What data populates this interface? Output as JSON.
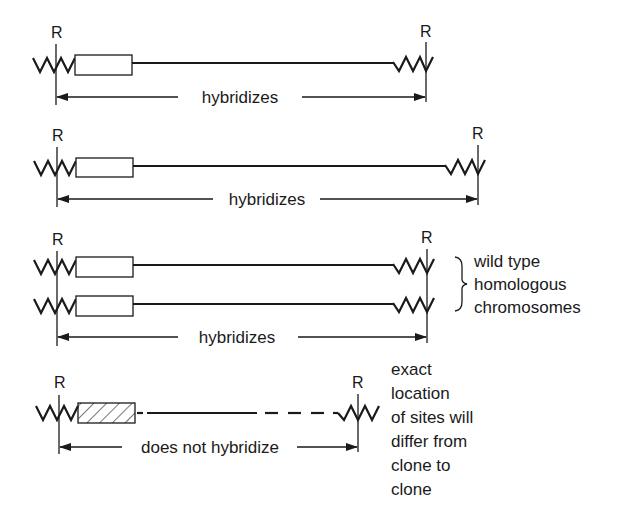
{
  "diagram": {
    "type": "restriction-fragment-hybridization",
    "site_label": "R",
    "colors": {
      "ink": "#1a1a1a",
      "background": "#ffffff"
    },
    "panels": [
      {
        "id": "panel-1",
        "site_labels": [
          "R",
          "R"
        ],
        "span_label": "hybridizes",
        "insert_style": "open-box",
        "chromosome_count": 1
      },
      {
        "id": "panel-2",
        "site_labels": [
          "R",
          "R"
        ],
        "span_label": "hybridizes",
        "insert_style": "open-box",
        "chromosome_count": 1
      },
      {
        "id": "panel-3",
        "site_labels": [
          "R",
          "R"
        ],
        "span_label": "hybridizes",
        "insert_style": "open-box",
        "chromosome_count": 2,
        "side_label_lines": [
          "wild type",
          "homologous",
          "chromosomes"
        ]
      },
      {
        "id": "panel-4",
        "site_labels": [
          "R",
          "R"
        ],
        "span_label": "does not hybridize",
        "insert_style": "hatched-box",
        "line_style": "partly-dashed",
        "chromosome_count": 1,
        "side_label_lines": [
          "exact",
          "location",
          "of sites will",
          "differ from",
          "clone to",
          "clone"
        ]
      }
    ]
  }
}
